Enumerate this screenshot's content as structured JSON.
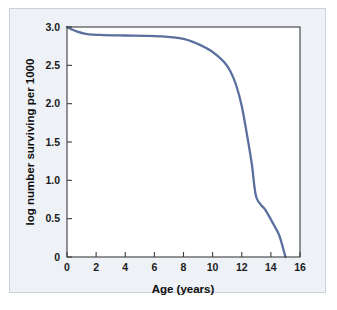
{
  "figure": {
    "panel_bg_color": "#eef1f6",
    "panel_border_color": "#c9d2dc",
    "plot_bg_color": "#ffffff",
    "axis_color": "#3c3c3c",
    "text_color": "#0d0d0d"
  },
  "chart_data": {
    "type": "line",
    "title": "",
    "subtitle": "",
    "xlabel": "Age (years)",
    "ylabel": "log number surviving per 1000",
    "xlim": [
      0,
      16
    ],
    "ylim": [
      0,
      3.0
    ],
    "xticks": [
      0,
      2,
      4,
      6,
      8,
      10,
      12,
      14,
      16
    ],
    "xtick_labels": [
      "0",
      "2",
      "4",
      "6",
      "8",
      "10",
      "12",
      "14",
      "16"
    ],
    "yticks": [
      0,
      0.5,
      1.0,
      1.5,
      2.0,
      2.5,
      3.0
    ],
    "ytick_labels": [
      "0",
      "0.5",
      "1.0",
      "1.5",
      "2.0",
      "2.5",
      "3.0"
    ],
    "grid": false,
    "legend": false,
    "legend_position": "none",
    "tick_direction": "in",
    "series": [
      {
        "name": "survivorship",
        "color": "#5a6f9e",
        "line_width": 2.3,
        "x": [
          0,
          0.3,
          0.7,
          1.2,
          1.8,
          2.5,
          3.5,
          4.5,
          5.5,
          6.5,
          7.3,
          8.0,
          8.6,
          9.2,
          9.8,
          10.3,
          10.8,
          11.2,
          11.6,
          12.0,
          12.4,
          12.7,
          13.0,
          13.6,
          14.2,
          14.6,
          15.0
        ],
        "y": [
          3.0,
          2.97,
          2.94,
          2.915,
          2.9,
          2.895,
          2.89,
          2.888,
          2.885,
          2.878,
          2.865,
          2.845,
          2.81,
          2.76,
          2.7,
          2.63,
          2.54,
          2.43,
          2.25,
          1.97,
          1.55,
          1.2,
          0.78,
          0.62,
          0.42,
          0.27,
          0.0
        ]
      }
    ]
  }
}
